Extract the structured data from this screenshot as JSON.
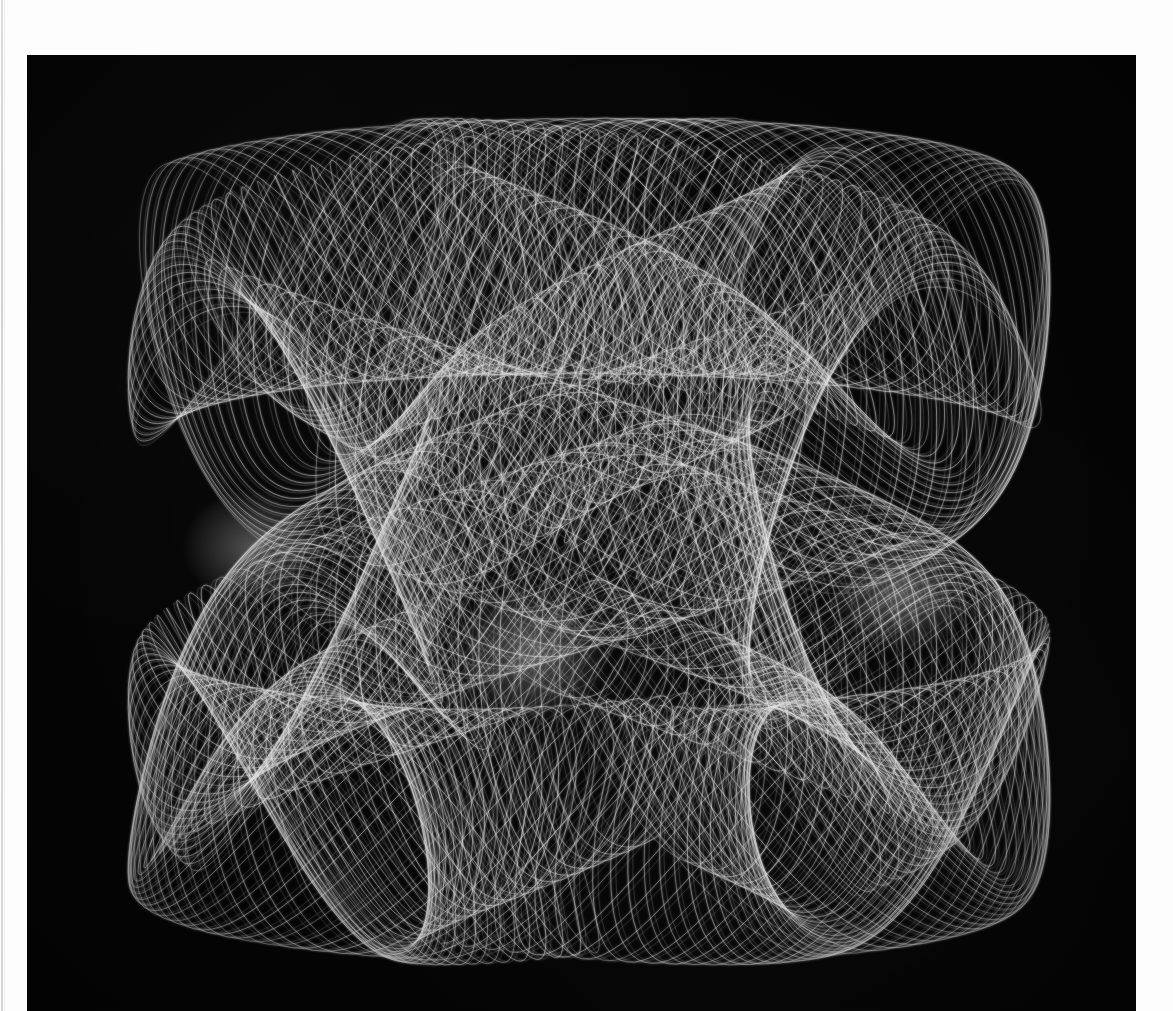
{
  "page": {
    "background_color": "#fdfdfd",
    "plate_color": "#050506",
    "trace_color": "#e8e8e8",
    "margin_rule_color": "#d2d2d2",
    "plate": {
      "left": 27,
      "top": 55,
      "width": 1109,
      "height": 956
    }
  },
  "chart_data": {
    "type": "line",
    "title": "",
    "subtitle": "",
    "xlabel": "",
    "ylabel": "",
    "grid": false,
    "legend_position": "none",
    "axes_visible": false,
    "tick_labels_x": [],
    "tick_labels_y": [],
    "background": "#050506",
    "line_color": "#e8e8e8",
    "line_width": 0.55,
    "curve_bounds_px": {
      "x_min": 128,
      "x_max": 1050,
      "y_min": 118,
      "y_max": 965
    },
    "parametric": {
      "form": "harmonograph",
      "x": "ax1*sin(f1*t + p1)*exp(-d1*t) + ax2*sin(f2*t + p2)*exp(-d2*t)",
      "y": "ay1*sin(f3*t + p3)*exp(-d3*t) + ay2*sin(f4*t + p4)*exp(-d4*t)",
      "t_start": 0,
      "t_end": 251.3274,
      "samples": 26000,
      "components": [
        {
          "axis": "x",
          "amplitude": 0.62,
          "frequency": 1.0,
          "phase": 0.0,
          "damping": 0.0
        },
        {
          "axis": "x",
          "amplitude": 0.3,
          "frequency": 7.0,
          "phase": 1.57,
          "damping": 0.0
        },
        {
          "axis": "y",
          "amplitude": 0.6,
          "frequency": 2.0,
          "phase": 0.4,
          "damping": 0.0
        },
        {
          "axis": "y",
          "amplitude": 0.26,
          "frequency": 11.0,
          "phase": 0.0,
          "damping": 0.0
        }
      ],
      "precession_rate": 0.0125,
      "note": "A slow 1:2 Lissajous carrier (two lobes) is modulated by faster 7 and 11 harmonics; a slow phase precession sweeps the mesh to fill the envelope."
    },
    "features": [
      {
        "name": "upper-left-lobe",
        "center_px": [
          400,
          330
        ],
        "note": "large arched lobe sweeping up-left"
      },
      {
        "name": "upper-right-lobe",
        "center_px": [
          870,
          330
        ],
        "note": "large arched lobe sweeping up-right"
      },
      {
        "name": "left-node",
        "center_px": [
          250,
          545
        ],
        "note": "bright crossing / caustic node"
      },
      {
        "name": "center-node",
        "center_px": [
          530,
          650
        ],
        "note": "bright central crossing of the S"
      },
      {
        "name": "right-node",
        "center_px": [
          900,
          590
        ],
        "note": "bright crossing / caustic node"
      },
      {
        "name": "lower-left-lobe",
        "center_px": [
          330,
          760
        ],
        "note": "broad lower sweeping lobe"
      },
      {
        "name": "lower-right-lobe",
        "center_px": [
          790,
          800
        ],
        "note": "broad lower sweeping lobe"
      }
    ]
  }
}
